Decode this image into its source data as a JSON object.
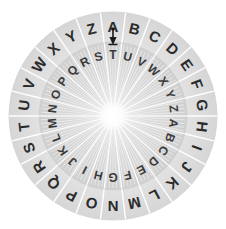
{
  "canvas": {
    "width": 226,
    "height": 229,
    "background_color": "#ffffff"
  },
  "device": {
    "name": "cipher-disk",
    "title": "Cipher Disk",
    "description": "Two concentric alphabet rings (Caesar cipher wheel) with a pointer marker at the top.",
    "center_x": 113,
    "center_y": 116,
    "outer_radius": 104,
    "inner_ring_inner_radius": 74,
    "inner_disk_radius": 74,
    "hub_radius": 8,
    "segment_count": 26,
    "segment_degrees": 13.846,
    "outer_ring_color": "#e2e2e2",
    "outer_ring_edge_color": "#d2d2d2",
    "inner_disk_color": "#d6d6d6",
    "separator_color": "#ffffff",
    "hub_color": "#ffffff",
    "letter_color_outer": "#2b2b2b",
    "letter_color_inner": "#3a3a3a",
    "marker_color": "#1a1a1a"
  },
  "outer_ring": {
    "name": "outer-alphabet-ring",
    "start_letter": "A",
    "start_angle_degrees": 0,
    "direction": "clockwise",
    "letters": [
      "A",
      "B",
      "C",
      "D",
      "E",
      "F",
      "G",
      "H",
      "I",
      "J",
      "K",
      "L",
      "M",
      "N",
      "O",
      "P",
      "Q",
      "R",
      "S",
      "T",
      "U",
      "V",
      "W",
      "X",
      "Y",
      "Z"
    ]
  },
  "inner_ring": {
    "name": "inner-alphabet-ring",
    "start_letter": "T",
    "shift": 19,
    "direction": "clockwise",
    "letters": [
      "T",
      "U",
      "V",
      "W",
      "X",
      "Y",
      "Z",
      "A",
      "B",
      "C",
      "D",
      "E",
      "F",
      "G",
      "H",
      "I",
      "J",
      "K",
      "L",
      "M",
      "N",
      "O",
      "P",
      "Q",
      "R",
      "S"
    ]
  },
  "marker": {
    "name": "index-pointer",
    "label": "A",
    "aligned_outer_letter": "A",
    "aligned_inner_letter": "T",
    "position_degrees": 0,
    "glyph": "down-arrow-pin"
  },
  "alignment_pairs": [
    {
      "outer": "A",
      "inner": "T"
    },
    {
      "outer": "B",
      "inner": "U"
    },
    {
      "outer": "C",
      "inner": "V"
    },
    {
      "outer": "D",
      "inner": "W"
    },
    {
      "outer": "E",
      "inner": "X"
    },
    {
      "outer": "F",
      "inner": "Y"
    },
    {
      "outer": "G",
      "inner": "Z"
    },
    {
      "outer": "H",
      "inner": "A"
    },
    {
      "outer": "I",
      "inner": "B"
    },
    {
      "outer": "J",
      "inner": "C"
    },
    {
      "outer": "K",
      "inner": "D"
    },
    {
      "outer": "L",
      "inner": "E"
    },
    {
      "outer": "M",
      "inner": "F"
    },
    {
      "outer": "N",
      "inner": "G"
    },
    {
      "outer": "O",
      "inner": "H"
    },
    {
      "outer": "P",
      "inner": "I"
    },
    {
      "outer": "Q",
      "inner": "J"
    },
    {
      "outer": "R",
      "inner": "K"
    },
    {
      "outer": "S",
      "inner": "L"
    },
    {
      "outer": "T",
      "inner": "M"
    },
    {
      "outer": "U",
      "inner": "N"
    },
    {
      "outer": "V",
      "inner": "O"
    },
    {
      "outer": "W",
      "inner": "P"
    },
    {
      "outer": "X",
      "inner": "Q"
    },
    {
      "outer": "Y",
      "inner": "R"
    },
    {
      "outer": "Z",
      "inner": "S"
    }
  ]
}
